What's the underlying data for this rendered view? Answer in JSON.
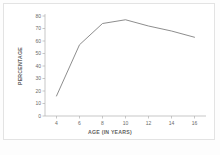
{
  "chart_data": {
    "type": "line",
    "title": "",
    "xlabel": "AGE (IN YEARS)",
    "ylabel": "PERCENTAGE",
    "x": [
      4,
      6,
      8,
      10,
      12,
      14,
      16
    ],
    "values": [
      16,
      57,
      74,
      77,
      72,
      68,
      63
    ],
    "series": [
      {
        "name": "percentage",
        "values": [
          16,
          57,
          74,
          77,
          72,
          68,
          63
        ]
      }
    ],
    "xlim": [
      3,
      17
    ],
    "ylim": [
      0,
      80
    ],
    "xticks": [
      4,
      6,
      8,
      10,
      12,
      14,
      16
    ],
    "yticks": [
      0,
      10,
      20,
      30,
      40,
      50,
      60,
      70,
      80
    ],
    "xtick_labels": [
      "4",
      "6",
      "8",
      "10",
      "12",
      "14",
      "16"
    ],
    "ytick_labels": [
      "0",
      "10",
      "20",
      "30",
      "40",
      "50",
      "60",
      "70",
      "80"
    ],
    "grid": false,
    "legend": false,
    "line_color": "#808080",
    "axis_color": "#b0b0b0",
    "background_color": "#ffffff"
  }
}
